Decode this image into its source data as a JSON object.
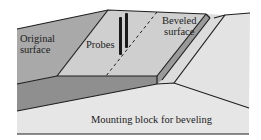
{
  "diagram": {
    "labels": {
      "original_surface_line1": "Original",
      "original_surface_line2": "surface",
      "probes": "Probes",
      "beveled_surface_line1": "Beveled",
      "beveled_surface_line2": "surface",
      "mounting_block": "Mounting block for beveling"
    },
    "colors": {
      "original_surface": "#a9a9a9",
      "beveled_surface": "#cfcfcf",
      "slab_edge": "#8f8f8f",
      "slab_side": "#9a9a9a",
      "mounting_block": "#e6e6e6",
      "mounting_right": "#dcdcdc",
      "outline": "#1e1e1e"
    }
  }
}
